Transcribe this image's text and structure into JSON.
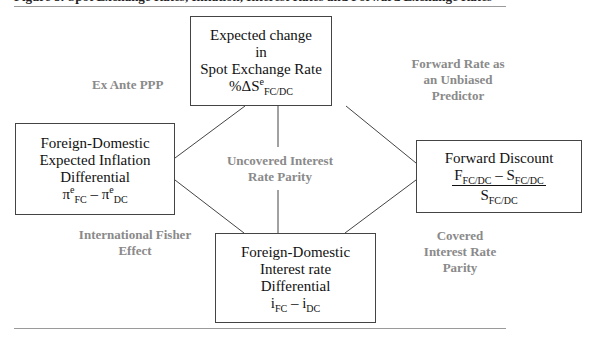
{
  "figure": {
    "title": "Figure 8: Spot Exchange Rates, Inflation, Interest Rates and Forward Exchange Rates"
  },
  "boxes": {
    "top": {
      "line1": "Expected change",
      "line2": "in",
      "line3": "Spot Exchange Rate",
      "formula": {
        "prefix": "%ΔS",
        "sup": "e",
        "sub": "FC/DC"
      }
    },
    "left": {
      "line1": "Foreign-Domestic",
      "line2": "Expected Inflation",
      "line3": "Differential",
      "formula": {
        "a": "π",
        "a_sup": "e",
        "a_sub": "FC",
        "op": " – ",
        "b": "π",
        "b_sup": "e",
        "b_sub": "DC"
      }
    },
    "right": {
      "line1": "Forward Discount",
      "formula": {
        "num_a": "F",
        "num_a_sub": "FC/DC",
        "op": " – ",
        "num_b": "S",
        "num_b_sub": "FC/DC",
        "den": "S",
        "den_sub": "FC/DC"
      }
    },
    "bottom": {
      "line1": "Foreign-Domestic",
      "line2": "Interest rate",
      "line3": "Differential",
      "formula": {
        "a": "i",
        "a_sub": "FC",
        "op": " – ",
        "b": "i",
        "b_sub": "DC"
      }
    }
  },
  "relations": {
    "ex_ante_ppp": "Ex Ante PPP",
    "forward_unbiased": [
      "Forward Rate as",
      "an Unbiased",
      "Predictor"
    ],
    "uncovered_irp": [
      "Uncovered Interest",
      "Rate Parity"
    ],
    "fisher": [
      "International Fisher",
      "Effect"
    ],
    "covered_irp": [
      "Covered",
      "Interest Rate",
      "Parity"
    ]
  },
  "colors": {
    "label_gray": "#8a8a8a",
    "box_border": "#444444",
    "rule": "#9a9a9a"
  }
}
